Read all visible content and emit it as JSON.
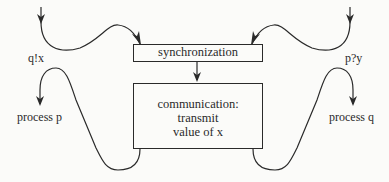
{
  "diagram": {
    "boxes": {
      "synchronization": "synchronization",
      "communication": [
        "communication:",
        "transmit",
        "value of x"
      ]
    },
    "labels": {
      "left_action": "q!x",
      "right_action": "p?y",
      "left_process": "process p",
      "right_process": "process q"
    },
    "colors": {
      "stroke": "#2a2a2a",
      "background": "#fbfbf9"
    }
  }
}
